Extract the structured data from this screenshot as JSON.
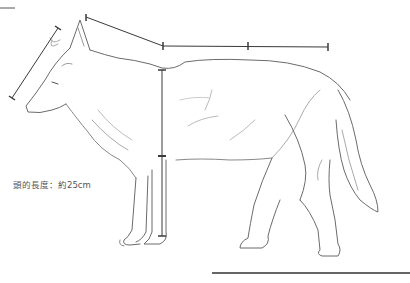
{
  "figure": {
    "annotation": {
      "head_length_label": "頭的長度：約25cm"
    },
    "measurements": [
      {
        "name": "head-length",
        "from": [
          12,
          98
        ],
        "to": [
          58,
          28
        ]
      },
      {
        "name": "neck-to-shoulder",
        "from": [
          86,
          17
        ],
        "to": [
          163,
          46
        ]
      },
      {
        "name": "back-length",
        "from": [
          163,
          46
        ],
        "to": [
          328,
          47
        ],
        "mid_tick": [
          248,
          46
        ]
      },
      {
        "name": "body-depth",
        "from": [
          162,
          70
        ],
        "to": [
          162,
          157
        ]
      },
      {
        "name": "leg-length",
        "from": [
          162,
          157
        ],
        "to": [
          162,
          236
        ]
      }
    ],
    "colors": {
      "pencil": "#6b6b6b",
      "pencil_light": "#b5b5b5",
      "measure_line": "#3a3a3a",
      "background": "#ffffff"
    }
  }
}
